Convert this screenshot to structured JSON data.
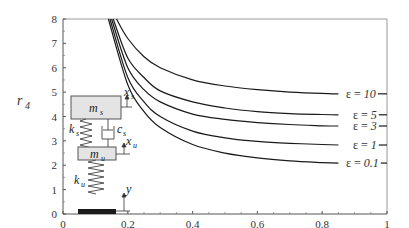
{
  "chart_data": {
    "type": "line",
    "title": "",
    "xlabel": "α",
    "ylabel": "r4",
    "xlim": [
      0,
      1
    ],
    "ylim": [
      0,
      8
    ],
    "x_ticks": [
      "0",
      "0.2",
      "0.4",
      "0.6",
      "0.8",
      "1"
    ],
    "y_ticks": [
      "0",
      "1",
      "2",
      "3",
      "4",
      "5",
      "6",
      "7",
      "8"
    ],
    "grid": false,
    "legend": "inline labels at right end of curves",
    "series": [
      {
        "name": "ε = 10",
        "label_eps": "10",
        "x": [
          0.165,
          0.2,
          0.25,
          0.3,
          0.4,
          0.5,
          0.6,
          0.7,
          0.8,
          0.85
        ],
        "values": [
          8.0,
          7.2,
          6.45,
          6.0,
          5.5,
          5.25,
          5.1,
          5.0,
          4.95,
          4.93
        ]
      },
      {
        "name": "ε = 5",
        "label_eps": "5",
        "x": [
          0.155,
          0.2,
          0.25,
          0.3,
          0.4,
          0.5,
          0.6,
          0.7,
          0.8,
          0.85
        ],
        "values": [
          8.0,
          6.4,
          5.6,
          5.05,
          4.6,
          4.35,
          4.2,
          4.12,
          4.08,
          4.07
        ]
      },
      {
        "name": "ε = 3",
        "label_eps": "3",
        "x": [
          0.15,
          0.2,
          0.25,
          0.3,
          0.4,
          0.5,
          0.6,
          0.7,
          0.8,
          0.85
        ],
        "values": [
          8.0,
          6.0,
          5.1,
          4.6,
          4.1,
          3.88,
          3.75,
          3.67,
          3.62,
          3.61
        ]
      },
      {
        "name": "ε = 1",
        "label_eps": "1",
        "x": [
          0.145,
          0.2,
          0.25,
          0.3,
          0.4,
          0.5,
          0.6,
          0.7,
          0.8,
          0.85
        ],
        "values": [
          8.0,
          5.6,
          4.6,
          4.0,
          3.4,
          3.12,
          2.98,
          2.9,
          2.85,
          2.83
        ]
      },
      {
        "name": "ε = 0.1",
        "label_eps": "0.1",
        "x": [
          0.14,
          0.2,
          0.25,
          0.3,
          0.4,
          0.5,
          0.6,
          0.7,
          0.8,
          0.85
        ],
        "values": [
          8.0,
          5.3,
          4.2,
          3.55,
          2.85,
          2.5,
          2.3,
          2.18,
          2.11,
          2.09
        ]
      }
    ]
  },
  "axes": {
    "xlabel": "α",
    "ylabel_main": "r",
    "ylabel_sub": "4"
  },
  "labels": {
    "eps_symbol": "ε = ",
    "curve_10": "10",
    "curve_5": "5",
    "curve_3": "3",
    "curve_1": "1",
    "curve_01": "0.1"
  },
  "inset_diagram": {
    "sprung_mass": "m",
    "sprung_mass_sub": "s",
    "unsprung_mass": "m",
    "unsprung_mass_sub": "u",
    "suspension_spring": "k",
    "suspension_spring_sub": "s",
    "damper": "c",
    "damper_sub": "s",
    "tire_spring": "k",
    "tire_spring_sub": "u",
    "disp_sprung": "x",
    "disp_sprung_sub": "s",
    "disp_unsprung": "x",
    "disp_unsprung_sub": "u",
    "road_input": "y"
  }
}
